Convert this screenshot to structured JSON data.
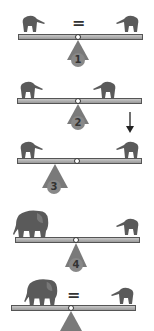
{
  "diagram": {
    "equals_symbol": "=",
    "panels": [
      {
        "number": "1",
        "label": "Equal elephants, centered fulcrum",
        "left": "small elephant",
        "right": "small elephant",
        "show_equals": true
      },
      {
        "number": "2",
        "label": "Equal elephants, centered fulcrum",
        "left": "small elephant",
        "right": "small elephant",
        "show_equals": false
      },
      {
        "number": "3",
        "label": "Fulcrum shifted left, force on right",
        "left": "small elephant",
        "right": "small elephant",
        "show_equals": false,
        "arrow": "down-arrow above right elephant"
      },
      {
        "number": "4",
        "label": "Large elephant vs small elephant",
        "left": "large elephant",
        "right": "small elephant",
        "show_equals": false
      },
      {
        "number": "5",
        "label": "Large elephant balanced with small elephant",
        "left": "large elephant",
        "right": "small elephant",
        "show_equals": true
      }
    ]
  },
  "colors": {
    "plank": "#a8a8a8",
    "fulcrum": "#7a7a7a",
    "elephant": "#5a5a5a",
    "background": "#ffffff"
  }
}
